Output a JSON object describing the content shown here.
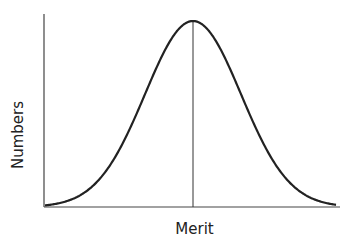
{
  "chart_data": {
    "type": "line",
    "title": "",
    "xlabel": "Merit",
    "ylabel": "Numbers",
    "grid": false,
    "legend": null,
    "x": [
      -3,
      -2.5,
      -2,
      -1.5,
      -1,
      -0.5,
      0,
      0.5,
      1,
      1.5,
      2,
      2.5,
      3
    ],
    "series": [
      {
        "name": "distribution",
        "values": [
          0.011,
          0.044,
          0.135,
          0.325,
          0.607,
          0.882,
          1.0,
          0.882,
          0.607,
          0.325,
          0.135,
          0.044,
          0.011
        ]
      }
    ],
    "annotations": [
      {
        "type": "vertical-line",
        "x": 0,
        "label": ""
      }
    ]
  },
  "labels": {
    "x_axis": "Merit",
    "y_axis": "Numbers"
  }
}
